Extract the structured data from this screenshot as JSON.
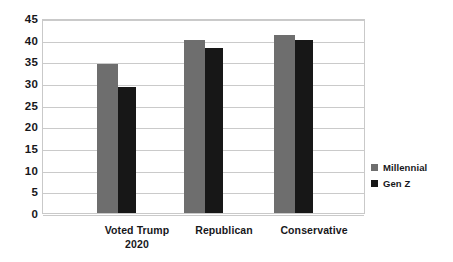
{
  "chart_data": {
    "type": "bar",
    "title": "",
    "xlabel": "",
    "ylabel": "",
    "ylim": [
      0,
      45
    ],
    "ytick_step": 5,
    "yticks": [
      45,
      40,
      35,
      30,
      25,
      20,
      15,
      10,
      5,
      0
    ],
    "grid": true,
    "legend_position": "right",
    "categories": [
      "Voted Trump 2020",
      "Republican",
      "Conservative"
    ],
    "category_lines": [
      [
        "Voted Trump",
        "2020"
      ],
      [
        "Republican"
      ],
      [
        "Conservative"
      ]
    ],
    "series": [
      {
        "name": "Millennial",
        "color": "#6e6e6e",
        "values": [
          34.5,
          40,
          41
        ]
      },
      {
        "name": "Gen Z",
        "color": "#171717",
        "values": [
          29,
          38,
          40
        ]
      }
    ]
  },
  "legend": {
    "items": [
      {
        "label": "Millennial",
        "swatch": "#6e6e6e"
      },
      {
        "label": "Gen Z",
        "swatch": "#171717"
      }
    ]
  }
}
